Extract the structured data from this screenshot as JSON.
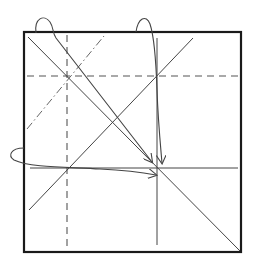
{
  "diagram": {
    "title": "",
    "type": "origami-folding-step",
    "square": {
      "x": 24,
      "y": 32,
      "size": 218
    },
    "lines": {
      "valley_vertical": {
        "x": 67,
        "y1": 36,
        "y2": 250,
        "style": "dashed"
      },
      "valley_horizontal": {
        "y": 76,
        "x1": 28,
        "x2": 238,
        "style": "dashed"
      },
      "mountain_diagonal": {
        "x1": 27,
        "y1": 129,
        "x2": 104,
        "y2": 36,
        "style": "dash-dot"
      },
      "main_diagonal": {
        "x1": 28,
        "y1": 37,
        "x2": 241,
        "y2": 252,
        "style": "solid"
      },
      "anti_diagonal": {
        "x1": 29,
        "y1": 210,
        "x2": 193,
        "y2": 38,
        "style": "solid"
      },
      "vertical_crease": {
        "x": 157,
        "y1": 38,
        "y2": 245,
        "style": "solid"
      },
      "horizontal_crease": {
        "y": 168,
        "x1": 30,
        "x2": 238,
        "style": "solid"
      }
    },
    "arrows": [
      {
        "name": "top-left-corner-arrow",
        "target": [
          152,
          163
        ]
      },
      {
        "name": "top-edge-arrow",
        "target": [
          162,
          164
        ]
      },
      {
        "name": "left-edge-arrow",
        "target": [
          155,
          175
        ]
      }
    ],
    "colors": {
      "border": "#1a1a1a",
      "lines": "#444444",
      "background": "#ffffff"
    }
  }
}
